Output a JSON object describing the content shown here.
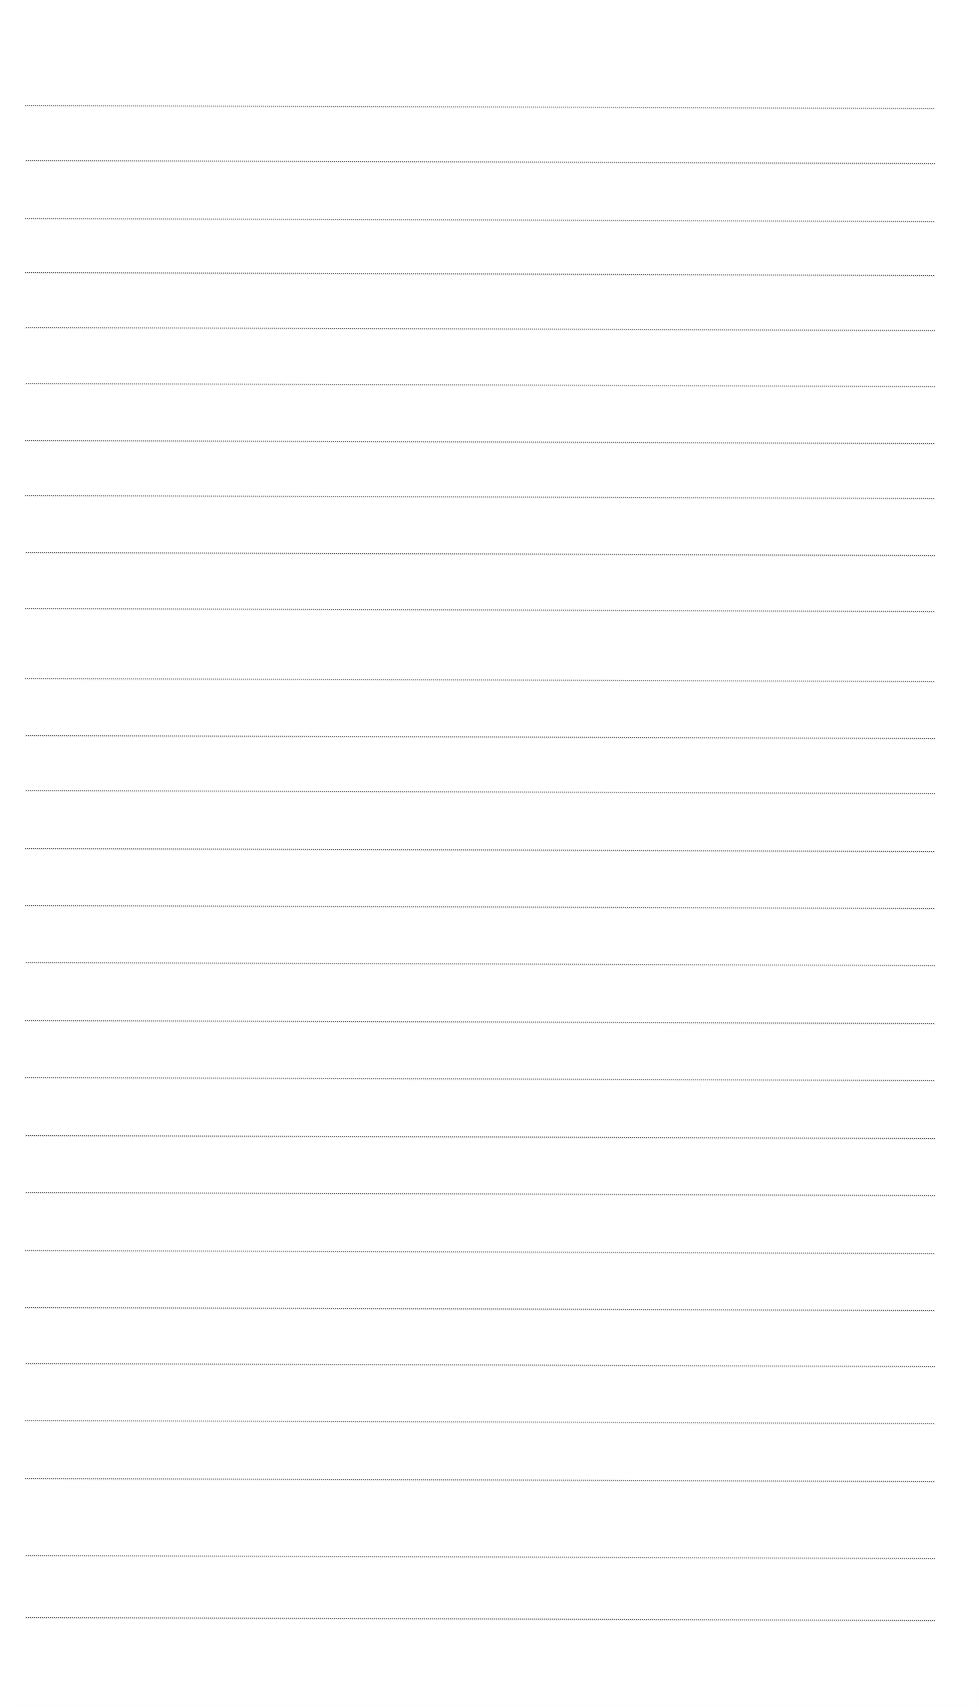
{
  "document": {
    "kind": "scanned-lined-paper",
    "title": "Blank Ruled Paper Scan",
    "page_width": 979,
    "page_height": 1707,
    "background_color": "#ffffff",
    "has_text": false,
    "text_content": "",
    "orientation": "portrait"
  },
  "rules": {
    "description": "Horizontal ruled guide lines on blank notebook paper",
    "count": 27,
    "ink_color": "#3c3c42",
    "echo_color": "#78788080",
    "left_x": 25,
    "right_x": 935,
    "line_thickness_px": 1,
    "average_spacing_px": 57,
    "skew_px_over_width": 3,
    "texture": "dotted-stipple",
    "y_positions": [
      105,
      160,
      218,
      272,
      327,
      383,
      440,
      495,
      552,
      608,
      678,
      735,
      790,
      848,
      905,
      962,
      1020,
      1077,
      1135,
      1192,
      1250,
      1307,
      1363,
      1420,
      1478,
      1555,
      1617
    ]
  },
  "margins": {
    "top_blank_px": 105,
    "bottom_blank_px": 90,
    "left_blank_px": 25,
    "right_blank_px": 44
  }
}
